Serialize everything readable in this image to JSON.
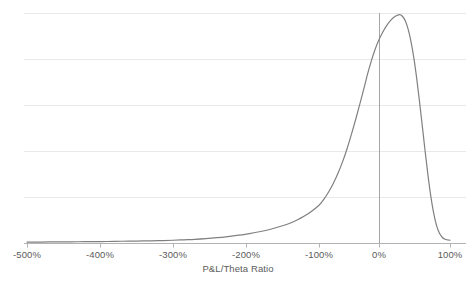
{
  "chart_data": {
    "type": "line",
    "title": "",
    "subtitle": "",
    "xlabel": "P&L/Theta Ratio",
    "ylabel": "",
    "xlim": [
      -500,
      100
    ],
    "ylim": [
      0,
      1.0
    ],
    "xtick_labels": [
      "-500%",
      "-400%",
      "-300%",
      "-200%",
      "-100%",
      "0%",
      "100%"
    ],
    "xtick_values": [
      -500,
      -400,
      -300,
      -200,
      -100,
      0,
      100
    ],
    "ytick_labels": [],
    "grid": "horizontal",
    "gridlines_y": [
      0.0,
      0.2,
      0.4,
      0.6,
      0.8,
      1.0
    ],
    "legend": "none",
    "legend_position": "none",
    "annotations": [
      {
        "name": "zero-reference-line",
        "type": "vline",
        "x": 0,
        "label": ""
      }
    ],
    "series": [
      {
        "name": "P&L/Theta distribution",
        "color": "#808080",
        "x": [
          -500,
          -480,
          -460,
          -440,
          -420,
          -400,
          -380,
          -360,
          -340,
          -320,
          -300,
          -285,
          -270,
          -255,
          -240,
          -225,
          -210,
          -195,
          -180,
          -165,
          -150,
          -140,
          -130,
          -120,
          -110,
          -100,
          -92,
          -84,
          -76,
          -68,
          -60,
          -53,
          -46,
          -39,
          -32,
          -25,
          -19,
          -13,
          -7,
          -1,
          5,
          11,
          17,
          23,
          29,
          33,
          37,
          41,
          45,
          49,
          53,
          57,
          61,
          65,
          69,
          73,
          77,
          81,
          85,
          89,
          93,
          97,
          100
        ],
        "y": [
          0.004,
          0.004,
          0.005,
          0.005,
          0.006,
          0.006,
          0.007,
          0.008,
          0.009,
          0.01,
          0.012,
          0.014,
          0.016,
          0.019,
          0.023,
          0.028,
          0.034,
          0.041,
          0.05,
          0.061,
          0.075,
          0.086,
          0.1,
          0.117,
          0.138,
          0.164,
          0.19,
          0.222,
          0.26,
          0.305,
          0.358,
          0.412,
          0.472,
          0.536,
          0.604,
          0.673,
          0.735,
          0.79,
          0.838,
          0.878,
          0.915,
          0.946,
          0.97,
          0.986,
          0.993,
          0.986,
          0.966,
          0.93,
          0.877,
          0.806,
          0.718,
          0.617,
          0.508,
          0.398,
          0.294,
          0.203,
          0.13,
          0.077,
          0.043,
          0.025,
          0.016,
          0.013,
          0.012
        ]
      }
    ]
  },
  "style": {
    "line_color": "#808080",
    "gridline_color": "#e9e9e9",
    "axis_color": "#b3b3b3",
    "reference_line_color": "#a6a6a6",
    "text_color": "#5b5b5b",
    "background": "#ffffff"
  },
  "geometry": {
    "plot_left": 24,
    "plot_right": 466,
    "plot_top": 13,
    "plot_bottom": 243,
    "tick_pixel_x": [
      27,
      100,
      173,
      246,
      319,
      379,
      450
    ],
    "tick_label_y": 250
  }
}
